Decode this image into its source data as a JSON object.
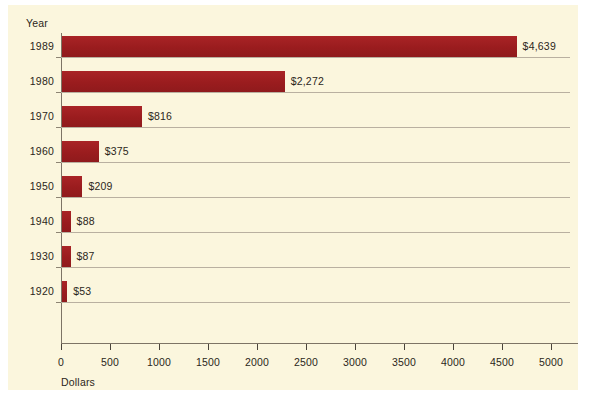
{
  "chart_data": {
    "type": "bar",
    "orientation": "horizontal",
    "title": "",
    "subtitle": "",
    "xlabel": "Dollars",
    "ylabel": "Year",
    "categories": [
      "1989",
      "1980",
      "1970",
      "1960",
      "1950",
      "1940",
      "1930",
      "1920"
    ],
    "values": [
      4639,
      2272,
      816,
      375,
      209,
      88,
      87,
      53
    ],
    "value_labels": [
      "$4,639",
      "$2,272",
      "$816",
      "$375",
      "$209",
      "$88",
      "$87",
      "$53"
    ],
    "xlim": [
      0,
      5000
    ],
    "xticks": [
      0,
      500,
      1000,
      1500,
      2000,
      2500,
      3000,
      3500,
      4000,
      4500,
      5000
    ],
    "xtick_labels": [
      "0",
      "500",
      "1000",
      "1500",
      "2000",
      "2500",
      "3000",
      "3500",
      "4000",
      "4500",
      "5000"
    ],
    "grid": true,
    "grid_axis": "y",
    "legend": false,
    "legend_position": "none",
    "series": [
      {
        "name": "Dollars",
        "values": [
          4639,
          2272,
          816,
          375,
          209,
          88,
          87,
          53
        ]
      }
    ],
    "colors": {
      "bar": "#9e1f20",
      "panel_background": "#fbf6dd",
      "page_background": "#ffffff",
      "gridline": "#b9b0a0",
      "axis": "#7d7465",
      "text": "#2b2620"
    }
  },
  "caption": {
    "text": ""
  }
}
